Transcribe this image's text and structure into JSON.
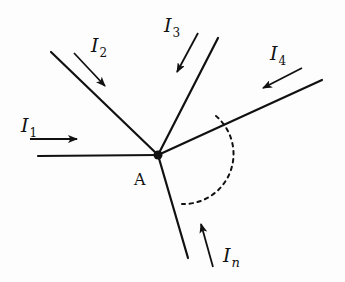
{
  "diagram": {
    "type": "circuit-node-kirchhoff",
    "node": {
      "label": "A",
      "x": 158,
      "y": 155
    },
    "branches": [
      {
        "id": "1",
        "from": [
          38,
          156
        ],
        "to": [
          158,
          155
        ]
      },
      {
        "id": "2",
        "from": [
          51,
          52
        ],
        "to": [
          158,
          155
        ]
      },
      {
        "id": "3",
        "from": [
          218,
          38
        ],
        "to": [
          158,
          155
        ]
      },
      {
        "id": "4",
        "from": [
          322,
          80
        ],
        "to": [
          158,
          155
        ]
      },
      {
        "id": "n",
        "from": [
          188,
          258
        ],
        "to": [
          158,
          155
        ]
      }
    ],
    "currents": [
      {
        "id": "I1",
        "symbol": "I",
        "subscript": "1",
        "direction": "toward-node",
        "arrow": [
          [
            30,
            139
          ],
          [
            77,
            139
          ]
        ]
      },
      {
        "id": "I2",
        "symbol": "I",
        "subscript": "2",
        "direction": "toward-node",
        "arrow": [
          [
            74,
            53
          ],
          [
            105,
            86
          ]
        ]
      },
      {
        "id": "I3",
        "symbol": "I",
        "subscript": "3",
        "direction": "toward-node",
        "arrow": [
          [
            198,
            33
          ],
          [
            177,
            72
          ]
        ]
      },
      {
        "id": "I4",
        "symbol": "I",
        "subscript": "4",
        "direction": "toward-node",
        "arrow": [
          [
            302,
            68
          ],
          [
            263,
            88
          ]
        ]
      },
      {
        "id": "In",
        "symbol": "I",
        "subscript": "n",
        "direction": "toward-node",
        "arrow": [
          [
            213,
            267
          ],
          [
            201,
            224
          ]
        ]
      }
    ],
    "dashed_arc": {
      "meaning": "additional branches omitted",
      "from_branch": "4",
      "to_branch": "n"
    },
    "colors": {
      "line": "#111111",
      "background": "#fdfdfd"
    }
  },
  "labels": {
    "node": "A",
    "i1": {
      "main": "I",
      "sub": "1"
    },
    "i2": {
      "main": "I",
      "sub": "2"
    },
    "i3": {
      "main": "I",
      "sub": "3"
    },
    "i4": {
      "main": "I",
      "sub": "4"
    },
    "in": {
      "main": "I",
      "sub": "n"
    }
  }
}
